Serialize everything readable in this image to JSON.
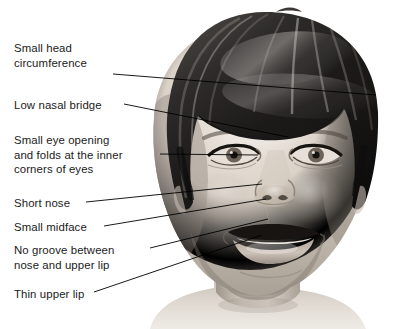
{
  "figure": {
    "type": "medical-illustration",
    "background_color": "#ffffff",
    "line_color": "#000000",
    "text_color": "#1a1a1a",
    "hair_color": "#2b2b2b",
    "skin_color": "#cfc6bd"
  },
  "labels": {
    "head_circumference": "Small head\ncircumference",
    "nasal_bridge": "Low nasal bridge",
    "eye_opening": "Small eye opening\nand folds at the inner\ncorners of eyes",
    "short_nose": "Short nose",
    "small_midface": "Small midface",
    "no_groove": "No groove between\nnose and upper lip",
    "thin_upper_lip": "Thin upper lip"
  },
  "leader_lines": [
    {
      "name": "head-circumference",
      "from": [
        113,
        74
      ],
      "to": [
        376,
        95
      ]
    },
    {
      "name": "nasal-bridge",
      "from": [
        124,
        104
      ],
      "to": [
        288,
        137
      ]
    },
    {
      "name": "eye-opening",
      "from": [
        160,
        154
      ],
      "to": [
        258,
        155
      ]
    },
    {
      "name": "short-nose",
      "from": [
        86,
        202
      ],
      "to": [
        262,
        184
      ]
    },
    {
      "name": "small-midface",
      "from": [
        104,
        226
      ],
      "to": [
        266,
        199
      ]
    },
    {
      "name": "no-groove",
      "from": [
        150,
        248
      ],
      "to": [
        268,
        219
      ]
    },
    {
      "name": "thin-upper-lip",
      "from": [
        94,
        292
      ],
      "to": [
        262,
        235
      ]
    }
  ]
}
